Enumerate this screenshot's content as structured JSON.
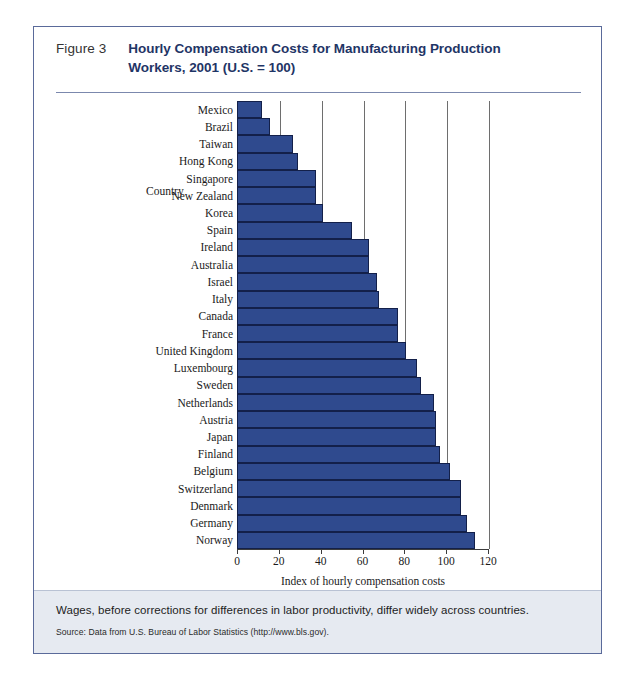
{
  "figure": {
    "number": "Figure 3",
    "title": "Hourly Compensation Costs for Manufacturing Production Workers, 2001 (U.S. = 100)",
    "title_line1": "Hourly Compensation Costs for Manufacturing Production",
    "title_line2": "Workers, 2001 (U.S. = 100)"
  },
  "caption": {
    "text": "Wages, before corrections for differences in labor productivity, differ widely across countries.",
    "source": "Source: Data from U.S. Bureau of Labor Statistics (http://www.bls.gov)."
  },
  "colors": {
    "bar_fill": "#2f4a8e",
    "bar_border": "#13204a",
    "frame_border": "#5a6a9a",
    "title_blue": "#1f3566",
    "caption_band": "#e6eaf1"
  },
  "chart_data": {
    "type": "bar",
    "orientation": "horizontal",
    "title": "Hourly Compensation Costs for Manufacturing Production Workers, 2001 (U.S. = 100)",
    "xlabel": "Index of hourly compensation costs",
    "ylabel": "Country",
    "category_axis_header": "Country",
    "xlim": [
      0,
      120
    ],
    "xticks": [
      0,
      20,
      40,
      60,
      80,
      100,
      120
    ],
    "grid": "vertical",
    "legend": "none",
    "categories": [
      "Mexico",
      "Brazil",
      "Taiwan",
      "Hong Kong",
      "Singapore",
      "New Zealand",
      "Korea",
      "Spain",
      "Ireland",
      "Australia",
      "Israel",
      "Italy",
      "Canada",
      "France",
      "United Kingdom",
      "Luxembourg",
      "Sweden",
      "Netherlands",
      "Austria",
      "Japan",
      "Finland",
      "Belgium",
      "Switzerland",
      "Denmark",
      "Germany",
      "Norway"
    ],
    "values": [
      12,
      16,
      27,
      29,
      38,
      38,
      41,
      55,
      63,
      63,
      67,
      68,
      77,
      77,
      81,
      86,
      88,
      94,
      95,
      95,
      97,
      102,
      107,
      107,
      110,
      114
    ]
  }
}
